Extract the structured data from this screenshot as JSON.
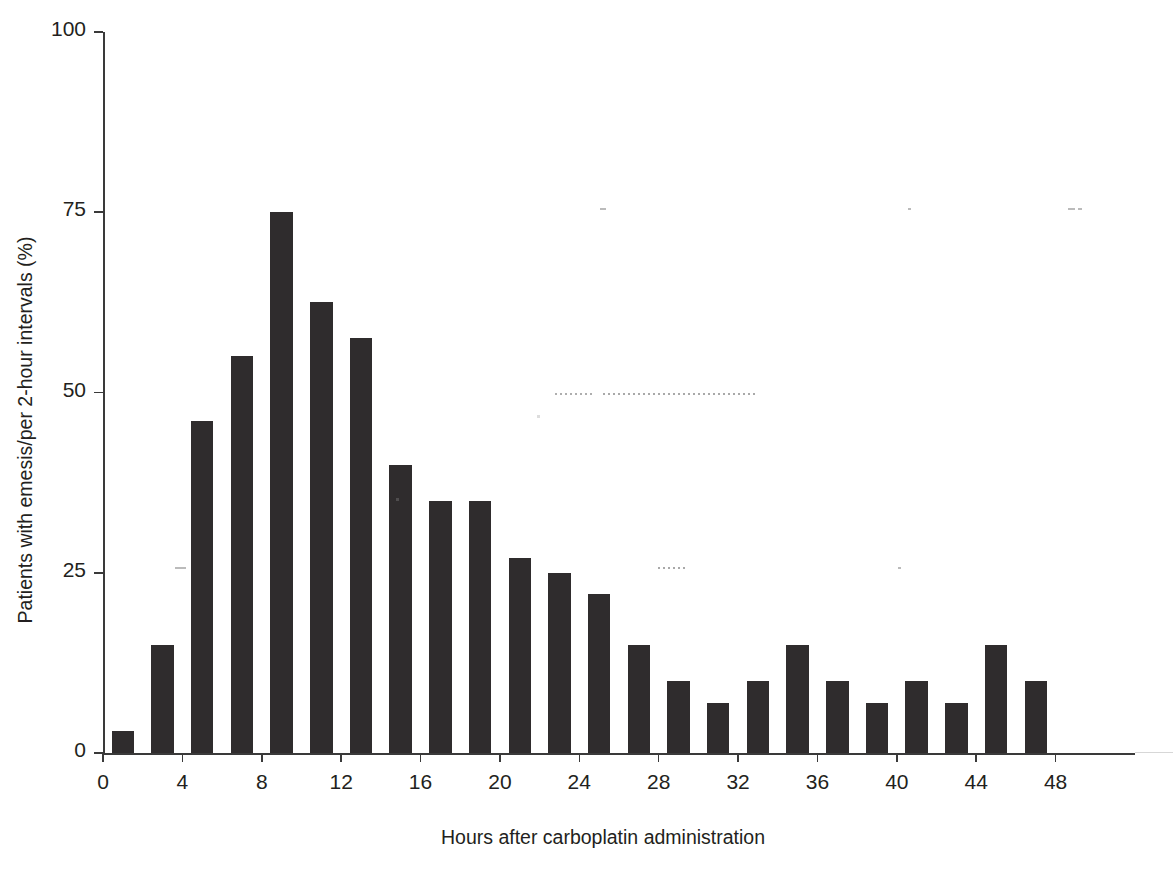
{
  "chart_data": {
    "type": "bar",
    "title": "",
    "xlabel": "Hours after carboplatin administration",
    "ylabel": "Patients with emesis/per 2-hour intervals (%)",
    "xlim": [
      0,
      52
    ],
    "ylim": [
      0,
      100
    ],
    "xticks": [
      0,
      4,
      8,
      12,
      16,
      20,
      24,
      28,
      32,
      36,
      40,
      44,
      48
    ],
    "xtick_labels": [
      "0",
      "4",
      "8",
      "12",
      "16",
      "20",
      "24",
      "28",
      "32",
      "36",
      "40",
      "44",
      "48"
    ],
    "yticks": [
      0,
      25,
      50,
      75,
      100
    ],
    "ytick_labels": [
      "0",
      "25",
      "50",
      "75",
      "100"
    ],
    "grid": false,
    "legend": "none",
    "bar_color": "#2f2c2d",
    "bin_width_hours": 2,
    "categories": [
      "0-2",
      "2-4",
      "4-6",
      "6-8",
      "8-10",
      "10-12",
      "12-14",
      "14-16",
      "16-18",
      "18-20",
      "20-22",
      "22-24",
      "24-26",
      "26-28",
      "28-30",
      "30-32",
      "32-34",
      "34-36",
      "36-38",
      "38-40",
      "40-42",
      "42-44",
      "44-46",
      "46-48"
    ],
    "x": [
      1,
      3,
      5,
      7,
      9,
      11,
      13,
      15,
      17,
      19,
      21,
      23,
      25,
      27,
      29,
      31,
      33,
      35,
      37,
      39,
      41,
      43,
      45,
      47
    ],
    "values": [
      3,
      15,
      46,
      55,
      75,
      62.5,
      57.5,
      40,
      35,
      35,
      27,
      25,
      22,
      15,
      10,
      7,
      10,
      15,
      10,
      7,
      10,
      7,
      15,
      10
    ]
  },
  "axes": {
    "y_title": "Patients with emesis/per 2-hour intervals (%)",
    "x_title": "Hours after carboplatin administration"
  }
}
